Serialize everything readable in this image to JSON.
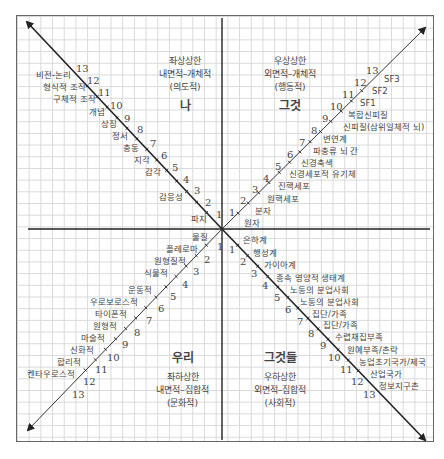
{
  "quadrants": {
    "upper_left": {
      "line1": "좌상상한",
      "line2": "내면적–개체적",
      "line3": "(의도적)",
      "pronoun": "나"
    },
    "upper_right": {
      "line1": "우상상한",
      "line2": "외면적–개체적",
      "line3": "(행동적)",
      "pronoun": "그것"
    },
    "lower_left": {
      "pronoun": "우리",
      "line1": "좌하상한",
      "line2": "내면적–집합적",
      "line3": "(문화적)"
    },
    "lower_right": {
      "pronoun": "그것들",
      "line1": "우하상한",
      "line2": "외면적–집합적",
      "line3": "(사회적)"
    }
  },
  "axes": {
    "upper_left": {
      "numbers": [
        "1",
        "2",
        "3",
        "4",
        "5",
        "6",
        "7",
        "8",
        "9",
        "10",
        "11",
        "12",
        "13"
      ],
      "labels": [
        "파지",
        "",
        "감응성",
        "",
        "감각",
        "지각",
        "충동",
        "정서",
        "상징",
        "개념",
        "구체적 조작",
        "형식적 조작",
        "비전-논리"
      ]
    },
    "upper_right": {
      "numbers": [
        "1",
        "2",
        "3",
        "4",
        "5",
        "6",
        "7",
        "8",
        "9",
        "10",
        "11",
        "12",
        "13"
      ],
      "labels": [
        "원자",
        "분자",
        "원핵세포",
        "진핵세포",
        "신경세포적 유기체",
        "신경축색",
        "파충류 뇌 간",
        "변연계",
        "신피질(삼위일체적 뇌)",
        "복합신피질",
        "SF1",
        "SF2",
        "SF3"
      ]
    },
    "lower_left": {
      "numbers": [
        "1",
        "2",
        "3",
        "4",
        "5",
        "6",
        "7",
        "8",
        "9",
        "10",
        "11",
        "12",
        "13"
      ],
      "labels": [
        "물질",
        "플레로마",
        "원형질적",
        "식물적",
        "운동적",
        "우로보로스적",
        "타이폰적",
        "원형적",
        "마술적",
        "신화적",
        "합리적",
        "켄타우로스적",
        ""
      ]
    },
    "lower_right": {
      "numbers": [
        "1",
        "2",
        "3",
        "4",
        "5",
        "6",
        "7",
        "8",
        "9",
        "10",
        "11",
        "12",
        "13"
      ],
      "labels": [
        "은하계",
        "행성계",
        "가이아계",
        "종속 영양적 생태계",
        "노동의 분업사회",
        "노동의 분업사회",
        "집단/가족",
        "집단/가족",
        "수렵채집부족",
        "원예부족/촌락",
        "농업초기국가/제국",
        "산업국가",
        "정보지구촌"
      ]
    }
  },
  "colors": {
    "grid": "#d9d9d9",
    "axis": "#222222",
    "text": "#444444"
  }
}
